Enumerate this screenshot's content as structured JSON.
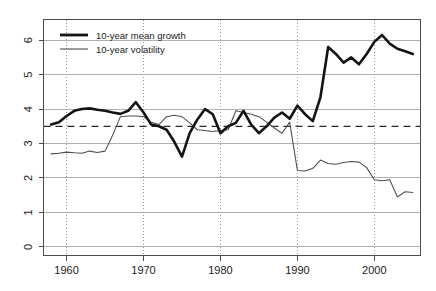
{
  "chart_data": {
    "type": "line",
    "title": "",
    "subtitle": "",
    "xlabel": "",
    "ylabel": "",
    "xlim": [
      1957,
      2006
    ],
    "ylim": [
      -0.25,
      6.6
    ],
    "grid": "horizontal gridlines at every integer y tick; vertical dotted gridlines at every decade x tick",
    "legend_position": "top-left inside plot area",
    "x_tick_labels": [
      "1960",
      "1970",
      "1980",
      "1990",
      "2000"
    ],
    "x_ticks": [
      1960,
      1970,
      1980,
      1990,
      2000
    ],
    "y_tick_labels": [
      "0",
      "1",
      "2",
      "3",
      "4",
      "5",
      "6"
    ],
    "y_ticks": [
      0,
      1,
      2,
      3,
      4,
      5,
      6
    ],
    "annotations": [
      {
        "name": "reference-line",
        "type": "horizontal-dashed",
        "value": 3.5
      }
    ],
    "series": [
      {
        "name": "10-year mean growth",
        "legend_label": "10-year mean growth",
        "style": "thick solid black",
        "color": "#141414",
        "x": [
          1958,
          1959,
          1960,
          1961,
          1962,
          1963,
          1964,
          1965,
          1966,
          1967,
          1968,
          1969,
          1970,
          1971,
          1972,
          1973,
          1974,
          1975,
          1976,
          1977,
          1978,
          1979,
          1980,
          1981,
          1982,
          1983,
          1984,
          1985,
          1986,
          1987,
          1988,
          1989,
          1990,
          1991,
          1992,
          1993,
          1994,
          1995,
          1996,
          1997,
          1998,
          1999,
          2000,
          2001,
          2002,
          2003,
          2004,
          2005
        ],
        "values": [
          3.55,
          3.62,
          3.8,
          3.95,
          4.0,
          4.02,
          3.98,
          3.95,
          3.9,
          3.86,
          3.95,
          4.2,
          3.9,
          3.55,
          3.5,
          3.4,
          3.05,
          2.62,
          3.3,
          3.7,
          4.0,
          3.85,
          3.3,
          3.5,
          3.6,
          3.95,
          3.55,
          3.3,
          3.5,
          3.75,
          3.9,
          3.72,
          4.1,
          3.85,
          3.65,
          4.35,
          5.8,
          5.6,
          5.35,
          5.5,
          5.3,
          5.6,
          5.95,
          6.15,
          5.9,
          5.75,
          5.68,
          5.6
        ]
      },
      {
        "name": "10-year volatility",
        "legend_label": "10-year volatility",
        "style": "thin solid grey",
        "color": "#4d4d4d",
        "x": [
          1958,
          1959,
          1960,
          1961,
          1962,
          1963,
          1964,
          1965,
          1966,
          1967,
          1968,
          1969,
          1970,
          1971,
          1972,
          1973,
          1974,
          1975,
          1976,
          1977,
          1978,
          1979,
          1980,
          1981,
          1982,
          1983,
          1984,
          1985,
          1986,
          1987,
          1988,
          1989,
          1990,
          1991,
          1992,
          1993,
          1994,
          1995,
          1996,
          1997,
          1998,
          1999,
          2000,
          2001,
          2002,
          2003,
          2004,
          2005
        ],
        "values": [
          2.7,
          2.72,
          2.75,
          2.73,
          2.72,
          2.78,
          2.74,
          2.78,
          3.25,
          3.78,
          3.8,
          3.8,
          3.78,
          3.62,
          3.55,
          3.78,
          3.82,
          3.78,
          3.6,
          3.4,
          3.38,
          3.35,
          3.38,
          3.4,
          3.95,
          3.9,
          3.85,
          3.78,
          3.62,
          3.45,
          3.3,
          3.62,
          2.22,
          2.2,
          2.28,
          2.52,
          2.42,
          2.4,
          2.45,
          2.48,
          2.46,
          2.3,
          1.95,
          1.92,
          1.95,
          1.45,
          1.6,
          1.58
        ]
      }
    ]
  },
  "legend": {
    "items": [
      {
        "label": "10-year mean growth",
        "style": "thick"
      },
      {
        "label": "10-year volatility",
        "style": "thin"
      }
    ]
  },
  "colors": {
    "growth": "#141414",
    "volatility": "#4d4d4d",
    "gridline": "#b0b0b0",
    "frame": "#4a4a4a",
    "background": "#ffffff"
  }
}
